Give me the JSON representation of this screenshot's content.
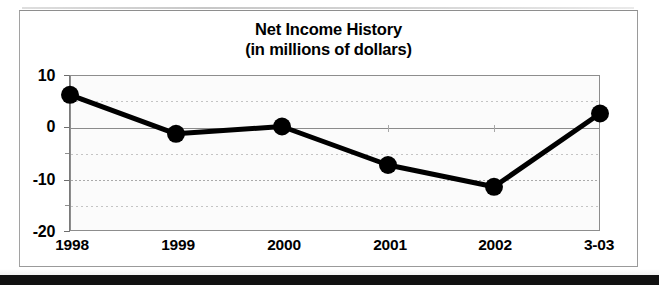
{
  "chart_data": {
    "type": "line",
    "title": "Net Income History",
    "subtitle": "(in millions of dollars)",
    "xlabel": "",
    "ylabel": "",
    "categories": [
      "1998",
      "1999",
      "2000",
      "2001",
      "2002",
      "3-03"
    ],
    "values": [
      6.2,
      -1.3,
      0.1,
      -7.3,
      -11.5,
      2.6
    ],
    "series": [
      {
        "name": "Net Income",
        "values": [
          6.2,
          -1.3,
          0.1,
          -7.3,
          -11.5,
          2.6
        ]
      }
    ],
    "ylim": [
      -20,
      10
    ],
    "ytick_labels": [
      "10",
      "0",
      "-10",
      "-20"
    ],
    "ytick_values": [
      10,
      0,
      -10,
      -20
    ],
    "yminor_values": [
      5,
      -5,
      -15
    ],
    "grid": true,
    "legend": false,
    "legend_position": "none",
    "marker": "filled-circle",
    "line_color": "#000000",
    "marker_color": "#000000",
    "plot_background": "#f7f7f7",
    "frame_color": "#8d8d8d"
  },
  "figure": {
    "title": "Net Income History",
    "subtitle": "(in millions of dollars)"
  },
  "axes": {
    "y_labels": [
      "10",
      "0",
      "-10",
      "-20"
    ],
    "x_labels": [
      "1998",
      "1999",
      "2000",
      "2001",
      "2002",
      "3-03"
    ]
  }
}
